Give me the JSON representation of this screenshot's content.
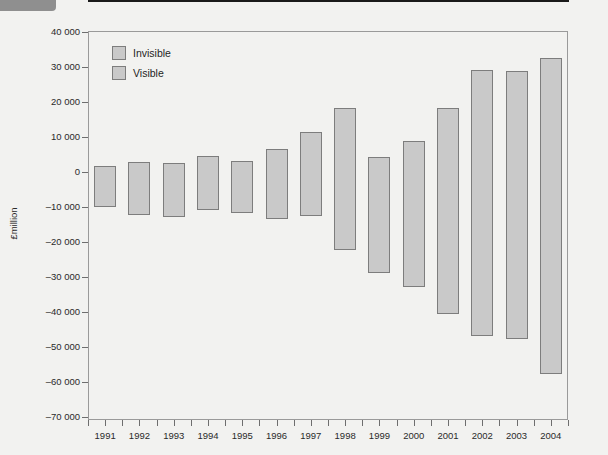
{
  "corner_tab": {
    "name": "tab-artifact"
  },
  "chart_data": {
    "type": "bar",
    "title": "",
    "subtitle": "",
    "xlabel": "",
    "ylabel": "£million",
    "ylim": [
      -70000,
      40000
    ],
    "ytick_step": 10000,
    "grid": false,
    "legend_position": "top-left",
    "categories": [
      "1991",
      "1992",
      "1993",
      "1994",
      "1995",
      "1996",
      "1997",
      "1998",
      "1999",
      "2000",
      "2001",
      "2002",
      "2003",
      "2004"
    ],
    "ytick_labels": [
      "40 000",
      "30 000",
      "20 000",
      "10 000",
      "0",
      "–10 000",
      "–20 000",
      "–30 000",
      "–40 000",
      "–50 000",
      "–60 000",
      "–70 000"
    ],
    "ytick_values": [
      40000,
      30000,
      20000,
      10000,
      0,
      -10000,
      -20000,
      -30000,
      -40000,
      -50000,
      -60000,
      -70000
    ],
    "legend": [
      {
        "label": "Invisible",
        "color": "#c9c9c9"
      },
      {
        "label": "Visible",
        "color": "#c9c9c9"
      }
    ],
    "series": [
      {
        "name": "Invisible",
        "values": [
          1700,
          2900,
          2600,
          4600,
          3100,
          6600,
          11400,
          18300,
          4300,
          8900,
          18300,
          29100,
          29000,
          32600
        ]
      },
      {
        "name": "Visible",
        "values": [
          -10000,
          -12300,
          -12900,
          -10900,
          -11700,
          -13400,
          -12600,
          -22300,
          -29000,
          -32900,
          -40600,
          -46900,
          -47700,
          -57700
        ]
      }
    ]
  }
}
